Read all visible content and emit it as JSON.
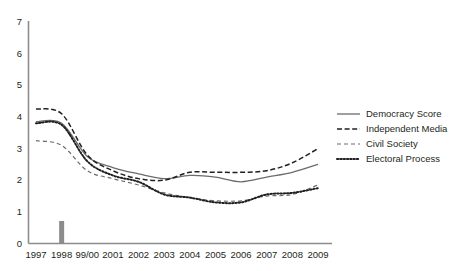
{
  "chart_data": {
    "type": "line",
    "title": "",
    "xlabel": "",
    "ylabel": "",
    "categories": [
      "1997",
      "1998",
      "99/00",
      "2001",
      "2002",
      "2003",
      "2004",
      "2005",
      "2006",
      "2007",
      "2008",
      "2009"
    ],
    "ylim": [
      0,
      7
    ],
    "yticks": [
      "0",
      "1",
      "2",
      "3",
      "4",
      "5",
      "6",
      "7"
    ],
    "grid": false,
    "legend_position": "right",
    "series": [
      {
        "name": "Democracy Score",
        "style": "solid",
        "color": "#6b6b6b",
        "values": [
          3.85,
          3.8,
          2.75,
          2.4,
          2.2,
          2.05,
          2.15,
          2.1,
          1.95,
          2.1,
          2.25,
          2.5
        ]
      },
      {
        "name": "Independent Media",
        "style": "dashed",
        "color": "#231f20",
        "values": [
          4.25,
          4.1,
          2.8,
          2.3,
          2.05,
          2.0,
          2.25,
          2.25,
          2.25,
          2.3,
          2.55,
          3.0
        ]
      },
      {
        "name": "Civil Society",
        "style": "dashed-fine",
        "color": "#6b6b6b",
        "values": [
          3.25,
          3.1,
          2.3,
          2.05,
          1.85,
          1.6,
          1.45,
          1.35,
          1.35,
          1.5,
          1.55,
          1.85
        ]
      },
      {
        "name": "Electoral Process",
        "style": "dotted",
        "color": "#231f20",
        "values": [
          3.8,
          3.75,
          2.6,
          2.15,
          1.95,
          1.55,
          1.45,
          1.3,
          1.3,
          1.55,
          1.6,
          1.75
        ]
      }
    ],
    "annotations": [
      {
        "name": "year-marker-1998",
        "category": "1998",
        "shape": "vertical-bar",
        "color": "#8c8c8c"
      }
    ]
  }
}
